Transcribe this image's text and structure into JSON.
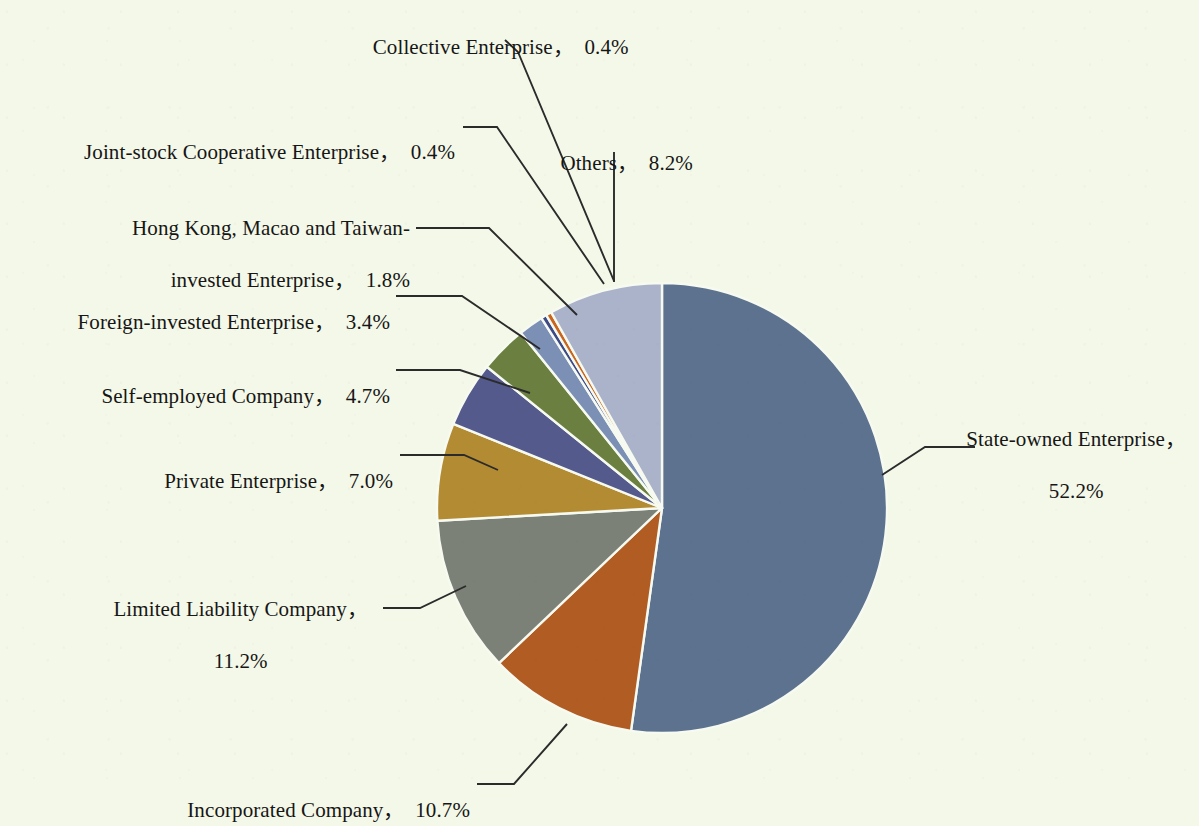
{
  "background_color": "#f4f8e8",
  "text_color": "#161616",
  "leader_line_color": "#2b2b2b",
  "slice_gap_color": "#f7faf0",
  "chart_data": {
    "type": "pie",
    "title": "",
    "subtitle": "",
    "xlabel": "",
    "ylabel": "",
    "legend_position": "none",
    "grid": false,
    "units": "percent",
    "start_angle_deg": 0,
    "direction": "counterclockwise",
    "categories": [
      "State-owned Enterprise",
      "Incorporated Company",
      "Limited Liability Company",
      "Private Enterprise",
      "Self-employed Company",
      "Foreign-invested Enterprise",
      "Hong Kong, Macao and Taiwan-invested Enterprise",
      "Joint-stock Cooperative Enterprise",
      "Collective Enterprise",
      "Others"
    ],
    "values": [
      52.2,
      10.7,
      11.2,
      7.0,
      4.7,
      3.4,
      1.8,
      0.4,
      0.4,
      8.2
    ],
    "colors": [
      "#5c728e",
      "#b05c22",
      "#7c8178",
      "#b38b33",
      "#545a8b",
      "#6b8040",
      "#7c90b6",
      "#3e4a86",
      "#c8651f",
      "#aab3c9"
    ],
    "slices": [
      {
        "label": "State-owned Enterprise",
        "value": 52.2,
        "display": "52.2%",
        "color": "#5c728e"
      },
      {
        "label": "Incorporated Company",
        "value": 10.7,
        "display": "10.7%",
        "color": "#b05c22"
      },
      {
        "label": "Limited Liability Company",
        "value": 11.2,
        "display": "11.2%",
        "color": "#7c8178"
      },
      {
        "label": "Private Enterprise",
        "value": 7.0,
        "display": "7.0%",
        "color": "#b38b33"
      },
      {
        "label": "Self-employed Company",
        "value": 4.7,
        "display": "4.7%",
        "color": "#545a8b"
      },
      {
        "label": "Foreign-invested Enterprise",
        "value": 3.4,
        "display": "3.4%",
        "color": "#6b8040"
      },
      {
        "label": "Hong Kong, Macao and Taiwan-invested Enterprise",
        "value": 1.8,
        "display": "1.8%",
        "color": "#7c90b6"
      },
      {
        "label": "Joint-stock Cooperative Enterprise",
        "value": 0.4,
        "display": "0.4%",
        "color": "#3e4a86"
      },
      {
        "label": "Collective Enterprise",
        "value": 0.4,
        "display": "0.4%",
        "color": "#c8651f"
      },
      {
        "label": "Others",
        "value": 8.2,
        "display": "8.2%",
        "color": "#aab3c9"
      }
    ]
  },
  "labels": {
    "collective": "Collective Enterprise，  0.4%",
    "joint_stock": "Joint-stock Cooperative Enterprise，  0.4%",
    "others": "Others，  8.2%",
    "hk_macao_line1": "Hong Kong, Macao and Taiwan-",
    "hk_macao_line2": "invested Enterprise，  1.8%",
    "foreign": "Foreign-invested Enterprise，  3.4%",
    "self_employed": "Self-employed Company，  4.7%",
    "private": "Private Enterprise，  7.0%",
    "limited_line1": "Limited Liability Company，",
    "limited_line2": "11.2%",
    "incorporated": "Incorporated Company，  10.7%",
    "state_owned_line1": "State-owned Enterprise，",
    "state_owned_line2": "52.2%"
  }
}
